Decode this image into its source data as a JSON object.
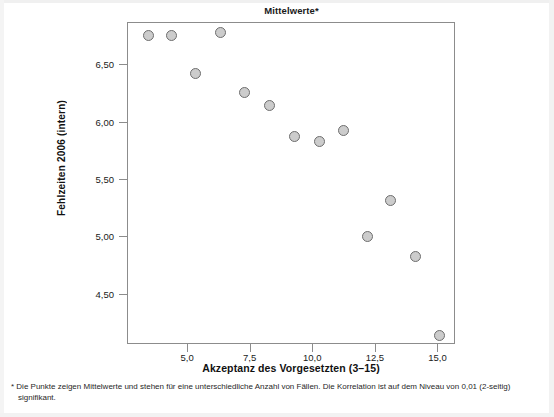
{
  "chart_data": {
    "type": "scatter",
    "title": "Mittelwerte*",
    "xlabel": "Akzeptanz des Vorgesetzten (3–15)",
    "ylabel": "Fehlzeiten 2006 (intern)",
    "xlim": [
      2.6,
      15.7
    ],
    "ylim": [
      4.06,
      6.87
    ],
    "xticks": [
      5.0,
      7.5,
      10.0,
      12.5,
      15.0
    ],
    "xtick_labels": [
      "5,0",
      "7,5",
      "10,0",
      "12,5",
      "15,0"
    ],
    "yticks": [
      6.5,
      6.0,
      5.5,
      5.0,
      4.5
    ],
    "ytick_labels": [
      "6,50",
      "6,00",
      "5,50",
      "5,00",
      "4,50"
    ],
    "grid": false,
    "legend": "none",
    "marker": {
      "shape": "circle",
      "fill_color": "#cccccc",
      "edge_color": "#6e6e6e",
      "size_px": 11
    },
    "points": [
      {
        "x": 3.4,
        "y": 6.76
      },
      {
        "x": 4.35,
        "y": 6.76
      },
      {
        "x": 5.3,
        "y": 6.43
      },
      {
        "x": 6.3,
        "y": 6.79
      },
      {
        "x": 7.25,
        "y": 6.26
      },
      {
        "x": 8.25,
        "y": 6.15
      },
      {
        "x": 9.25,
        "y": 5.88
      },
      {
        "x": 10.25,
        "y": 5.84
      },
      {
        "x": 11.2,
        "y": 5.93
      },
      {
        "x": 12.15,
        "y": 5.01
      },
      {
        "x": 13.1,
        "y": 5.32
      },
      {
        "x": 14.1,
        "y": 4.83
      },
      {
        "x": 15.05,
        "y": 4.14
      }
    ],
    "annotations": [
      "* Die Punkte zeigen Mittelwerte und stehen für eine unterschiedliche Anzahl von Fällen. Die Korrelation ist auf dem Niveau von 0,01 (2-seitig) signifikant."
    ]
  },
  "footnote": {
    "text": "* Die Punkte zeigen Mittelwerte und stehen für eine unterschiedliche Anzahl von Fällen. Die Korrelation ist auf dem Niveau von 0,01 (2-seitig) signifikant."
  }
}
